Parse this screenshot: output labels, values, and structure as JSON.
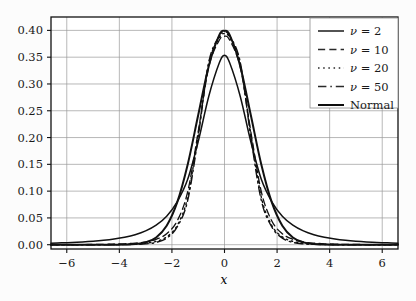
{
  "chart_data": {
    "type": "line",
    "title": "",
    "subtitle": "",
    "xlabel": "x",
    "ylabel": "",
    "xlim": [
      -6.6,
      6.6
    ],
    "ylim": [
      -0.008,
      0.425
    ],
    "xticks": [
      -6,
      -4,
      -2,
      0,
      2,
      4,
      6
    ],
    "xticklabels": [
      "−6",
      "−4",
      "−2",
      "0",
      "2",
      "4",
      "6"
    ],
    "yticks": [
      0.0,
      0.05,
      0.1,
      0.15,
      0.2,
      0.25,
      0.3,
      0.35,
      0.4
    ],
    "yticklabels": [
      "0.00",
      "0.05",
      "0.10",
      "0.15",
      "0.20",
      "0.25",
      "0.30",
      "0.35",
      "0.40"
    ],
    "grid": true,
    "legend_position": "top-right",
    "series": [
      {
        "name": "ν = 2",
        "legend_label": "ν = 2",
        "linestyle": "solid",
        "color": "#1a1a1a",
        "linewidth": 1.5,
        "peak": 0.3536,
        "x": [
          -6.6,
          -6.2,
          -5.8,
          -5.4,
          -5.0,
          -4.6,
          -4.2,
          -3.8,
          -3.4,
          -3.0,
          -2.6,
          -2.2,
          -1.8,
          -1.4,
          -1.0,
          -0.6,
          -0.2,
          0.0,
          0.2,
          0.6,
          1.0,
          1.4,
          1.8,
          2.2,
          2.6,
          3.0,
          3.4,
          3.8,
          4.2,
          4.6,
          5.0,
          5.4,
          5.8,
          6.2,
          6.6
        ],
        "y": [
          0.00288,
          0.00346,
          0.0042,
          0.00515,
          0.00642,
          0.00813,
          0.01048,
          0.0138,
          0.01861,
          0.0257,
          0.03648,
          0.05332,
          0.08011,
          0.12202,
          0.19245,
          0.2767,
          0.33901,
          0.35355,
          0.33901,
          0.2767,
          0.19245,
          0.12202,
          0.08011,
          0.05332,
          0.03648,
          0.0257,
          0.01861,
          0.0138,
          0.01048,
          0.00813,
          0.00642,
          0.00515,
          0.0042,
          0.00346,
          0.00288
        ]
      },
      {
        "name": "ν = 10",
        "legend_label": "ν = 10",
        "linestyle": "dashed",
        "color": "#2a2a2a",
        "linewidth": 1.3,
        "peak": 0.3891,
        "x": [
          -6.6,
          -6.2,
          -5.8,
          -5.4,
          -5.0,
          -4.6,
          -4.2,
          -3.8,
          -3.4,
          -3.0,
          -2.6,
          -2.2,
          -1.8,
          -1.4,
          -1.0,
          -0.6,
          -0.2,
          0.0,
          0.2,
          0.6,
          1.0,
          1.4,
          1.8,
          2.2,
          2.6,
          3.0,
          3.4,
          3.8,
          4.2,
          4.6,
          5.0,
          5.4,
          5.8,
          6.2,
          6.6
        ],
        "y": [
          0.00011,
          0.00015,
          0.00021,
          0.0003,
          0.00044,
          0.00067,
          0.00105,
          0.00171,
          0.00292,
          0.00527,
          0.01009,
          0.02059,
          0.0444,
          0.09896,
          0.21123,
          0.33115,
          0.38155,
          0.3891,
          0.38155,
          0.33115,
          0.21123,
          0.09896,
          0.0444,
          0.02059,
          0.01009,
          0.00527,
          0.00292,
          0.00171,
          0.00105,
          0.00067,
          0.00044,
          0.0003,
          0.00021,
          0.00015,
          0.00011
        ]
      },
      {
        "name": "ν = 20",
        "legend_label": "ν = 20",
        "linestyle": "dotted",
        "color": "#2a2a2a",
        "linewidth": 1.4,
        "peak": 0.394,
        "x": [
          -6.6,
          -6.2,
          -5.8,
          -5.4,
          -5.0,
          -4.6,
          -4.2,
          -3.8,
          -3.4,
          -3.0,
          -2.6,
          -2.2,
          -1.8,
          -1.4,
          -1.0,
          -0.6,
          -0.2,
          0.0,
          0.2,
          0.6,
          1.0,
          1.4,
          1.8,
          2.2,
          2.6,
          3.0,
          3.4,
          3.8,
          4.2,
          4.6,
          5.0,
          5.4,
          5.8,
          6.2,
          6.6
        ],
        "y": [
          2e-05,
          3e-05,
          5e-05,
          8e-05,
          0.00013,
          0.00022,
          0.00038,
          0.0007,
          0.00135,
          0.00281,
          0.00623,
          0.01466,
          0.03588,
          0.0888,
          0.20703,
          0.3381,
          0.386,
          0.39397,
          0.386,
          0.3381,
          0.20703,
          0.0888,
          0.03588,
          0.01466,
          0.00623,
          0.00281,
          0.00135,
          0.0007,
          0.00038,
          0.00022,
          0.00013,
          8e-05,
          5e-05,
          3e-05,
          2e-05
        ]
      },
      {
        "name": "ν = 50",
        "legend_label": "ν = 50",
        "linestyle": "dashdot",
        "color": "#2a2a2a",
        "linewidth": 1.4,
        "peak": 0.397,
        "x": [
          -6.6,
          -6.2,
          -5.8,
          -5.4,
          -5.0,
          -4.6,
          -4.2,
          -3.8,
          -3.4,
          -3.0,
          -2.6,
          -2.2,
          -1.8,
          -1.4,
          -1.0,
          -0.6,
          -0.2,
          0.0,
          0.2,
          0.6,
          1.0,
          1.4,
          1.8,
          2.2,
          2.6,
          3.0,
          3.4,
          3.8,
          4.2,
          4.6,
          5.0,
          5.4,
          5.8,
          6.2,
          6.6
        ],
        "y": [
          1e-06,
          2e-06,
          5e-06,
          1e-05,
          2.1e-05,
          4.5e-05,
          0.000101,
          0.000237,
          0.000588,
          0.001555,
          0.00438,
          0.01234,
          0.0332,
          0.0827,
          0.2012,
          0.3405,
          0.3893,
          0.397,
          0.3893,
          0.3405,
          0.2012,
          0.0827,
          0.0332,
          0.01234,
          0.00438,
          0.001555,
          0.000588,
          0.000237,
          0.000101,
          4.5e-05,
          2.1e-05,
          1e-05,
          5e-06,
          2e-06,
          1e-06
        ]
      },
      {
        "name": "Normal",
        "legend_label": "Normal",
        "linestyle": "solid",
        "color": "#0d0d0d",
        "linewidth": 2.0,
        "peak": 0.3989,
        "x": [
          -6.6,
          -6.2,
          -5.8,
          -5.4,
          -5.0,
          -4.6,
          -4.2,
          -3.8,
          -3.4,
          -3.0,
          -2.6,
          -2.2,
          -1.8,
          -1.4,
          -1.0,
          -0.6,
          -0.2,
          0.0,
          0.2,
          0.6,
          1.0,
          1.4,
          1.8,
          2.2,
          2.6,
          3.0,
          3.4,
          3.8,
          4.2,
          4.6,
          5.0,
          5.4,
          5.8,
          6.2,
          6.6
        ],
        "y": [
          0.0,
          0.0,
          0.0,
          1e-07,
          1.5e-06,
          1.06e-05,
          6.59e-05,
          0.0002919,
          0.0011912,
          0.0044318,
          0.013583,
          0.0354746,
          0.0789502,
          0.1497275,
          0.2419707,
          0.3332246,
          0.3910427,
          0.3989423,
          0.3910427,
          0.3332246,
          0.2419707,
          0.1497275,
          0.0789502,
          0.0354746,
          0.013583,
          0.0044318,
          0.0011912,
          0.0002919,
          6.59e-05,
          1.06e-05,
          1.5e-06,
          1e-07,
          0.0,
          0.0,
          0.0
        ]
      }
    ]
  }
}
